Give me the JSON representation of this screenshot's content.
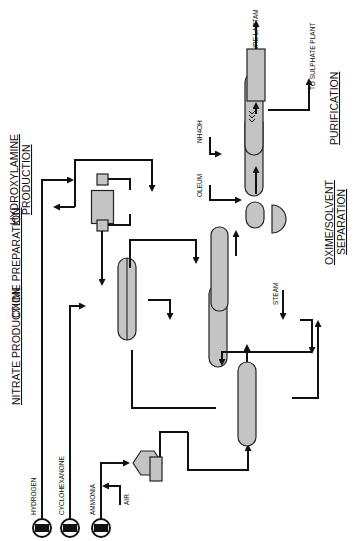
{
  "sections": {
    "nitrate": "NITRATE PRODUCTION",
    "oxime": "OXIME PREPARATION",
    "hydroxylamine_1": "HYDROXYLAMINE",
    "hydroxylamine_2": "PRODUCTION",
    "separation_1": "OXIME/SOLVENT",
    "separation_2": "SEPARATION",
    "purification": "PURIFICATION"
  },
  "feeds": {
    "hydrogen": "HYDROGEN",
    "cyclohexanone": "CYCLOHEXANONE",
    "ammonia": "AMMONIA",
    "air": "AIR",
    "steam": "STEAM",
    "oleum": "OLEUM",
    "nh4oh": "NH4OH",
    "start": "START"
  },
  "outputs": {
    "pure_lactam": "PURE LACTAM",
    "sulphate": "TO SULPHATE PLANT"
  },
  "colors": {
    "vessel_fill": "#c4c4c4",
    "line": "#111111",
    "background": "#ffffff"
  }
}
